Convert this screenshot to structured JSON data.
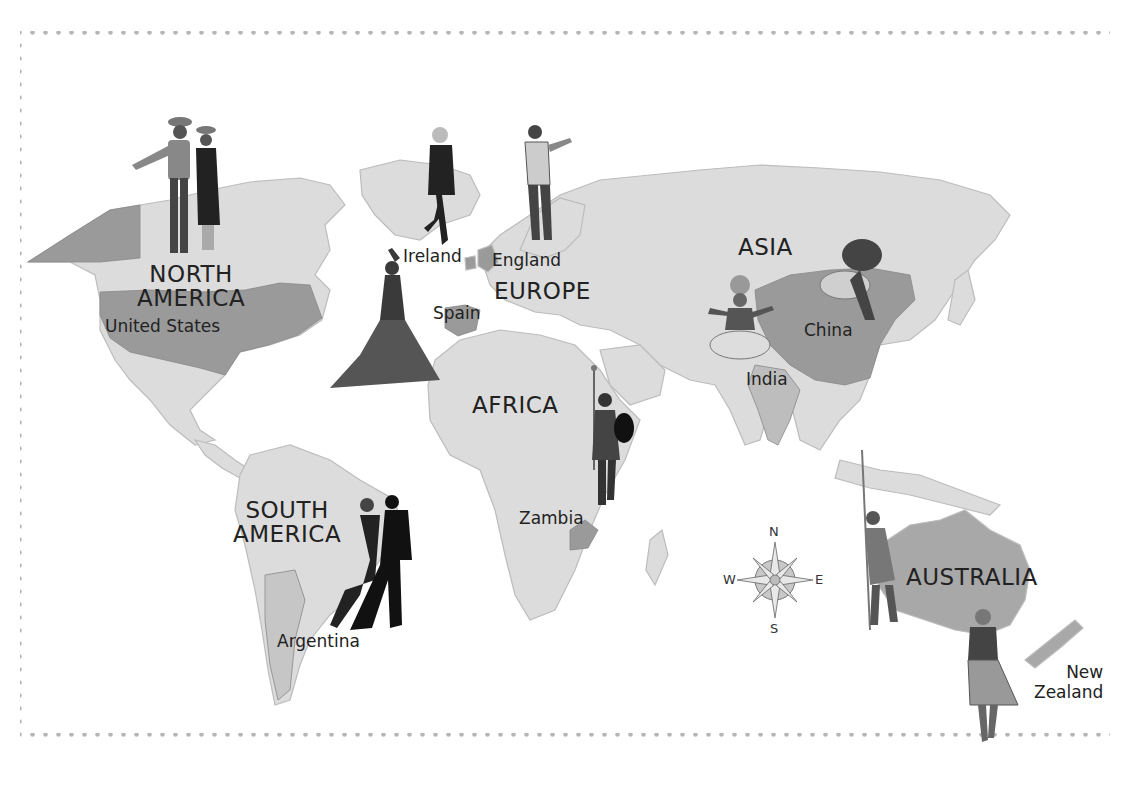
{
  "map": {
    "title": "",
    "colors": {
      "background": "#ffffff",
      "land": "#dcdcdc",
      "land_stroke": "#bcbcbc",
      "highlighted_country": "#9a9a9a",
      "border_dots": "#b5b5b5",
      "text": "#222222"
    },
    "continents": [
      {
        "id": "north-america",
        "label": "NORTH AMERICA",
        "line1": "NORTH",
        "line2": "AMERICA"
      },
      {
        "id": "south-america",
        "label": "SOUTH AMERICA",
        "line1": "SOUTH",
        "line2": "AMERICA"
      },
      {
        "id": "europe",
        "label": "EUROPE"
      },
      {
        "id": "africa",
        "label": "AFRICA"
      },
      {
        "id": "asia",
        "label": "ASIA"
      },
      {
        "id": "australia",
        "label": "AUSTRALIA"
      }
    ],
    "countries": [
      {
        "id": "united-states",
        "label": "United States",
        "dancer": "square dance couple"
      },
      {
        "id": "ireland",
        "label": "Ireland",
        "dancer": "Irish step dancer"
      },
      {
        "id": "england",
        "label": "England",
        "dancer": "morris dancer"
      },
      {
        "id": "spain",
        "label": "Spain",
        "dancer": "flamenco dancer"
      },
      {
        "id": "zambia",
        "label": "Zambia",
        "dancer": "warrior dancer with spear and shield"
      },
      {
        "id": "india",
        "label": "India",
        "dancer": "Kathakali dancer"
      },
      {
        "id": "china",
        "label": "China",
        "dancer": "lion dancer"
      },
      {
        "id": "argentina",
        "label": "Argentina",
        "dancer": "tango couple"
      },
      {
        "id": "australia-country",
        "label": "",
        "dancer": "Aboriginal dancer with spear"
      },
      {
        "id": "new-zealand",
        "label": "New Zealand",
        "line1": "New",
        "line2": "Zealand",
        "dancer": "Maori dancer"
      }
    ],
    "compass": {
      "n": "N",
      "s": "S",
      "e": "E",
      "w": "W"
    }
  }
}
